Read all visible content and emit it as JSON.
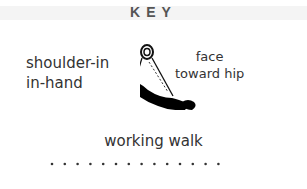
{
  "key": {
    "title": "KEY",
    "items": [
      {
        "label_line1": "shoulder-in",
        "label_line2": "in-hand"
      },
      {
        "label_line1": "face",
        "label_line2": "toward hip"
      },
      {
        "label": "working walk"
      }
    ],
    "dot_count": 14
  }
}
